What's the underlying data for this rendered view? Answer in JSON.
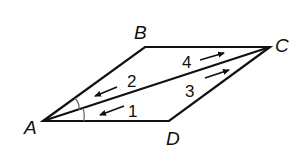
{
  "diagram": {
    "type": "geometry-parallelogram",
    "stroke_color": "#111111",
    "angle_arc_color": "#777777",
    "vertices": [
      {
        "name": "A",
        "label": "A",
        "x": 43,
        "y": 121
      },
      {
        "name": "B",
        "label": "B",
        "x": 145,
        "y": 47
      },
      {
        "name": "C",
        "label": "C",
        "x": 270,
        "y": 47
      },
      {
        "name": "D",
        "label": "D",
        "x": 169,
        "y": 121
      }
    ],
    "segments": [
      "AB",
      "BC",
      "CD",
      "DA",
      "AC"
    ],
    "angles": [
      {
        "label": "1",
        "near": "A",
        "between": "AC and AD"
      },
      {
        "label": "2",
        "near": "A",
        "between": "AB and AC"
      },
      {
        "label": "3",
        "near": "C",
        "between": "CA and CD"
      },
      {
        "label": "4",
        "near": "C",
        "between": "CB and CA"
      }
    ],
    "angle_labels": {
      "a1": "1",
      "a2": "2",
      "a3": "3",
      "a4": "4"
    },
    "vertex_labels": {
      "A": "A",
      "B": "B",
      "C": "C",
      "D": "D"
    },
    "arrows": [
      {
        "near_angle": "1",
        "direction": "toward A"
      },
      {
        "near_angle": "2",
        "direction": "toward A"
      },
      {
        "near_angle": "3",
        "direction": "toward C"
      },
      {
        "near_angle": "4",
        "direction": "toward C"
      }
    ],
    "congruence_marks": "angles 1 and 2 marked with single arcs at A"
  }
}
